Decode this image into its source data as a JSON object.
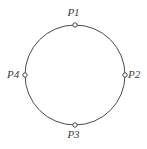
{
  "figure": {
    "type": "circle-with-four-marked-points",
    "background_color": "#ffffff",
    "stroke_color": "#4a4a4a",
    "label_color": "#3b3b3b",
    "marker_fill_color": "#ffffff",
    "circle": {
      "center_x": 75,
      "center_y": 75,
      "radius": 50,
      "stroke_width": 1
    },
    "points": [
      {
        "label": "P1",
        "position": "top",
        "x": 75,
        "y": 25,
        "angle_degrees": 90,
        "label_x": 75,
        "label_y": 13
      },
      {
        "label": "P2",
        "position": "right",
        "x": 125,
        "y": 75,
        "angle_degrees": 0,
        "label_x": 135,
        "label_y": 75
      },
      {
        "label": "P3",
        "position": "bottom",
        "x": 75,
        "y": 125,
        "angle_degrees": 270,
        "label_x": 75,
        "label_y": 135
      },
      {
        "label": "P4",
        "position": "left",
        "x": 25,
        "y": 75,
        "angle_degrees": 180,
        "label_x": 14,
        "label_y": 75
      }
    ],
    "marker": {
      "shape": "open-circle",
      "radius": 2.2,
      "stroke_width": 1
    }
  }
}
